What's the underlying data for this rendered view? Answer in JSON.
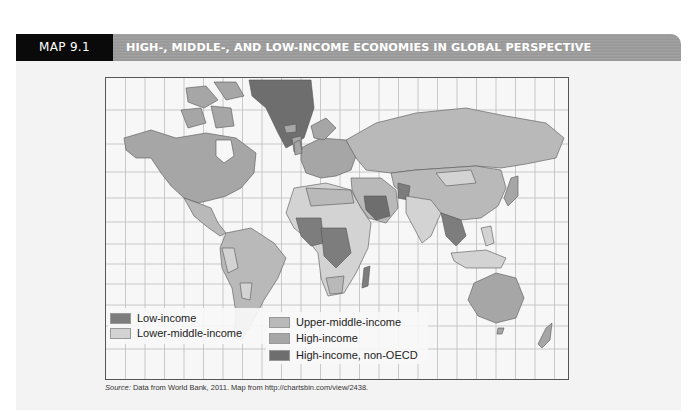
{
  "header": {
    "map_number": "MAP 9.1",
    "title": "HIGH-, MIDDLE-, AND LOW-INCOME ECONOMIES IN GLOBAL PERSPECTIVE"
  },
  "legend": {
    "items": [
      {
        "label": "Low-income",
        "color": "#7d7d7d"
      },
      {
        "label": "Lower-middle-income",
        "color": "#d3d3d3"
      },
      {
        "label": "Upper-middle-income",
        "color": "#b9b9b9"
      },
      {
        "label": "High-income",
        "color": "#a6a6a6"
      },
      {
        "label": "High-income, non-OECD",
        "color": "#6e6e6e"
      }
    ]
  },
  "source": {
    "prefix": "Source:",
    "text": " Data from World Bank, 2011. Map from http://chartsbin.com/view/2438."
  },
  "colors": {
    "ocean": "#f7f7f7",
    "grid": "#bdbdbd",
    "header_black": "#0a0a0a",
    "header_band": "#9d9d9d",
    "panel": "#f3f3f3"
  }
}
